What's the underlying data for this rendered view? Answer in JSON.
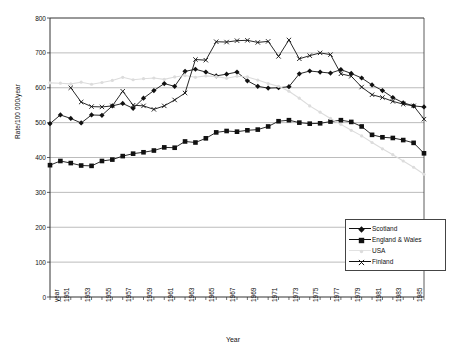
{
  "chart_data": {
    "type": "line",
    "title": "",
    "xlabel": "Year",
    "ylabel": "Rate/100 000/year",
    "ylim": [
      0,
      800
    ],
    "ytick_step": 100,
    "yticks": [
      0,
      100,
      200,
      300,
      400,
      500,
      600,
      700,
      800
    ],
    "grid": true,
    "xlim": [
      1950,
      1986
    ],
    "x": [
      1950,
      1951,
      1952,
      1953,
      1954,
      1955,
      1956,
      1957,
      1958,
      1959,
      1960,
      1961,
      1962,
      1963,
      1964,
      1965,
      1966,
      1967,
      1968,
      1969,
      1970,
      1971,
      1972,
      1973,
      1974,
      1975,
      1976,
      1977,
      1978,
      1979,
      1980,
      1981,
      1982,
      1983,
      1984,
      1985,
      1986
    ],
    "xtick_labels": [
      "year",
      "1951",
      "1953",
      "1955",
      "1957",
      "1959",
      "1961",
      "1963",
      "1965",
      "1967",
      "1969",
      "1971",
      "1973",
      "1975",
      "1977",
      "1979",
      "1981",
      "1983",
      "1985"
    ],
    "xtick_label_years": [
      1950,
      1951,
      1953,
      1955,
      1957,
      1959,
      1961,
      1963,
      1965,
      1967,
      1969,
      1971,
      1973,
      1975,
      1977,
      1979,
      1981,
      1983,
      1985
    ],
    "legend_position": "bottom-right",
    "series": [
      {
        "name": "Scotland",
        "marker": "diamond",
        "color": "#111111",
        "x": [
          1950,
          1951,
          1952,
          1953,
          1954,
          1955,
          1956,
          1957,
          1958,
          1959,
          1960,
          1961,
          1962,
          1963,
          1964,
          1965,
          1966,
          1967,
          1968,
          1969,
          1970,
          1971,
          1972,
          1973,
          1974,
          1975,
          1976,
          1977,
          1978,
          1979,
          1980,
          1981,
          1982,
          1983,
          1984,
          1985,
          1986
        ],
        "values": [
          497,
          522,
          512,
          499,
          522,
          521,
          548,
          555,
          541,
          570,
          592,
          612,
          604,
          647,
          653,
          645,
          634,
          639,
          645,
          620,
          604,
          599,
          600,
          603,
          640,
          648,
          645,
          642,
          652,
          641,
          628,
          608,
          592,
          572,
          557,
          548,
          545
        ]
      },
      {
        "name": "England & Wales",
        "marker": "square",
        "color": "#111111",
        "x": [
          1950,
          1951,
          1952,
          1953,
          1954,
          1955,
          1956,
          1957,
          1958,
          1959,
          1960,
          1961,
          1962,
          1963,
          1964,
          1965,
          1966,
          1967,
          1968,
          1969,
          1970,
          1971,
          1972,
          1973,
          1974,
          1975,
          1976,
          1977,
          1978,
          1979,
          1980,
          1981,
          1982,
          1983,
          1984,
          1985,
          1986
        ],
        "values": [
          378,
          390,
          384,
          377,
          376,
          390,
          394,
          404,
          411,
          415,
          420,
          429,
          428,
          446,
          443,
          455,
          472,
          476,
          474,
          478,
          480,
          489,
          504,
          507,
          500,
          497,
          498,
          503,
          507,
          502,
          489,
          465,
          458,
          456,
          450,
          442,
          412
        ]
      },
      {
        "name": "USA",
        "marker": "dot",
        "color": "#dcdcdc",
        "x": [
          1950,
          1951,
          1952,
          1953,
          1954,
          1955,
          1956,
          1957,
          1958,
          1959,
          1960,
          1961,
          1962,
          1963,
          1964,
          1965,
          1966,
          1967,
          1968,
          1969,
          1970,
          1971,
          1972,
          1973,
          1974,
          1975,
          1976,
          1977,
          1978,
          1979,
          1980,
          1981,
          1982,
          1983,
          1984,
          1985,
          1986
        ],
        "values": [
          614,
          613,
          611,
          616,
          610,
          615,
          621,
          630,
          623,
          626,
          628,
          624,
          631,
          635,
          630,
          634,
          632,
          627,
          633,
          631,
          622,
          612,
          604,
          590,
          570,
          548,
          530,
          512,
          495,
          478,
          462,
          443,
          425,
          408,
          390,
          372,
          352
        ]
      },
      {
        "name": "Finland",
        "marker": "cross",
        "color": "#111111",
        "x": [
          1952,
          1953,
          1954,
          1955,
          1956,
          1957,
          1958,
          1959,
          1960,
          1961,
          1962,
          1963,
          1964,
          1965,
          1966,
          1967,
          1968,
          1969,
          1970,
          1971,
          1972,
          1973,
          1974,
          1975,
          1976,
          1977,
          1978,
          1979,
          1980,
          1981,
          1982,
          1983,
          1984,
          1985,
          1986
        ],
        "values": [
          600,
          559,
          546,
          545,
          548,
          590,
          550,
          548,
          538,
          548,
          565,
          585,
          681,
          679,
          732,
          731,
          735,
          736,
          730,
          733,
          690,
          737,
          683,
          692,
          700,
          695,
          640,
          633,
          602,
          580,
          572,
          561,
          553,
          548,
          510
        ]
      }
    ]
  },
  "legend": {
    "entries": [
      {
        "label": "Scotland"
      },
      {
        "label": "England & Wales"
      },
      {
        "label": "USA"
      },
      {
        "label": "Finland"
      }
    ]
  },
  "axes": {
    "y_title": "Rate/100 000/year",
    "x_title": "Year"
  }
}
